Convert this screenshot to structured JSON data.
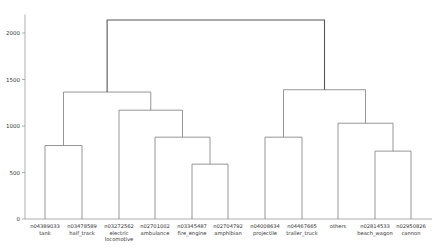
{
  "chart_data": {
    "type": "dendrogram",
    "title": "",
    "xlabel": "",
    "ylabel": "",
    "ylim": [
      0,
      2200
    ],
    "yticks": [
      0,
      500,
      1000,
      1500,
      2000
    ],
    "grid": false,
    "legend": null,
    "leaves": [
      {
        "id": "n04389033",
        "name": "tank"
      },
      {
        "id": "n03478589",
        "name": "half_track"
      },
      {
        "id": "n03272562",
        "name": "electric locomotive"
      },
      {
        "id": "n02701002",
        "name": "ambulance"
      },
      {
        "id": "n03345487",
        "name": "fire_engine"
      },
      {
        "id": "n02704792",
        "name": "amphibian"
      },
      {
        "id": "n04008634",
        "name": "projectile"
      },
      {
        "id": "n04467665",
        "name": "trailer_truck"
      },
      {
        "id": "",
        "name": "others"
      },
      {
        "id": "n02814533",
        "name": "beach_wagon"
      },
      {
        "id": "n02950826",
        "name": "cannon"
      }
    ],
    "merges": [
      {
        "left": "leaf:0",
        "right": "leaf:1",
        "height": 790
      },
      {
        "left": "leaf:4",
        "right": "leaf:5",
        "height": 590
      },
      {
        "left": "leaf:3",
        "right": "m:1",
        "height": 880
      },
      {
        "left": "leaf:2",
        "right": "m:2",
        "height": 1170
      },
      {
        "left": "m:0",
        "right": "m:3",
        "height": 1365
      },
      {
        "left": "leaf:6",
        "right": "leaf:7",
        "height": 880
      },
      {
        "left": "leaf:9",
        "right": "leaf:10",
        "height": 730
      },
      {
        "left": "leaf:8",
        "right": "m:6",
        "height": 1030
      },
      {
        "left": "m:5",
        "right": "m:7",
        "height": 1390
      },
      {
        "left": "m:4",
        "right": "m:8",
        "height": 2140
      }
    ]
  },
  "colors": {
    "line": "#8a8a8a",
    "root_line": "#555555",
    "axis": "#999999",
    "text": "#333333"
  },
  "layout": {
    "plot_left": 25,
    "plot_right": 432,
    "baseline_y": 219,
    "px_per_unit": 0.093,
    "leaf_x": [
      45,
      82,
      119,
      155,
      192,
      228,
      265,
      302,
      338,
      375,
      411
    ]
  }
}
